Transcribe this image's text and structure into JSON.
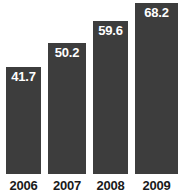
{
  "chart_data": {
    "type": "bar",
    "title": "",
    "subtitle": "",
    "xlabel": "",
    "ylabel": "",
    "categories": [
      "2006",
      "2007",
      "2008",
      "2009"
    ],
    "values": [
      41.7,
      50.2,
      59.6,
      68.2
    ],
    "value_labels": [
      "41.7",
      "50.2",
      "59.6",
      "68.2"
    ],
    "series": [
      {
        "name": "",
        "values": [
          41.7,
          50.2,
          59.6,
          68.2
        ]
      }
    ],
    "ylim": [
      0,
      72.5
    ],
    "grid": false,
    "legend": false,
    "legend_position": "none",
    "annotations": [],
    "colors": {
      "bar_fill": "#3d3d3d",
      "value_label": "#ffffff",
      "axis_label": "#1a1a1a",
      "background": "#ffffff"
    },
    "bars": [
      {
        "category": "2006",
        "value": 41.7,
        "label": "41.7",
        "left_px": 6,
        "width_px": 35,
        "top_px": 67
      },
      {
        "category": "2007",
        "value": 50.2,
        "label": "50.2",
        "left_px": 48,
        "width_px": 38,
        "top_px": 43
      },
      {
        "category": "2008",
        "value": 59.6,
        "label": "59.6",
        "left_px": 93,
        "width_px": 35,
        "top_px": 21
      },
      {
        "category": "2009",
        "value": 68.2,
        "label": "68.2",
        "left_px": 135,
        "width_px": 43,
        "top_px": 3
      }
    ]
  }
}
